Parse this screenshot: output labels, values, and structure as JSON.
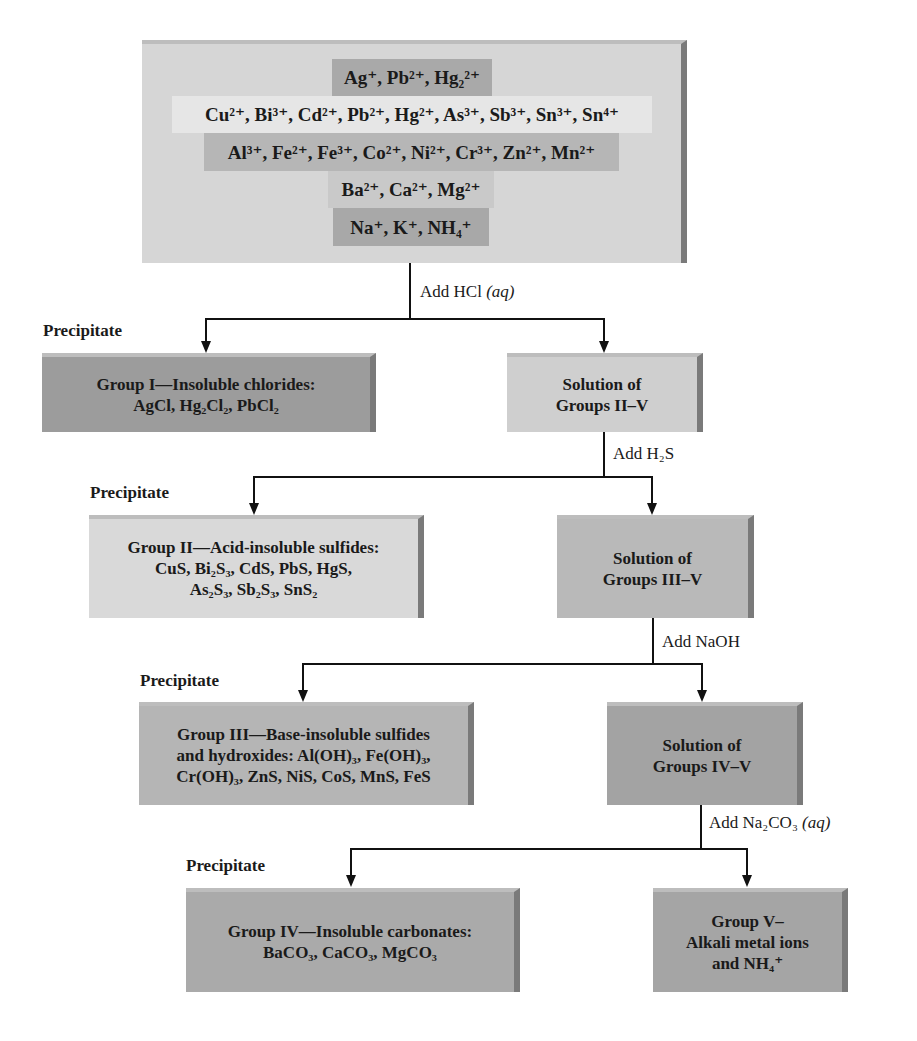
{
  "top_box": {
    "color": "#d6d6d6",
    "rows": [
      {
        "label": "Ag⁺, Pb²⁺, Hg₂²⁺",
        "color": "#a9a9a9"
      },
      {
        "label": "Cu²⁺, Bi³⁺, Cd²⁺, Pb²⁺, Hg²⁺, As³⁺, Sb³⁺, Sn³⁺, Sn⁴⁺",
        "color": "#e6e6e6"
      },
      {
        "label": "Al³⁺, Fe²⁺, Fe³⁺, Co²⁺, Ni²⁺, Cr³⁺, Zn²⁺, Mn²⁺",
        "color": "#b6b6b6"
      },
      {
        "label": "Ba²⁺, Ca²⁺, Mg²⁺",
        "color": "#c9c9c9"
      },
      {
        "label": "Na⁺, K⁺, NH₄⁺",
        "color": "#a8a8a8"
      }
    ]
  },
  "steps": [
    {
      "reagent": "Add HCl",
      "reagent_state": "(aq)",
      "precipitate_label": "Precipitate",
      "precipitate": {
        "title": "Group I—Insoluble chlorides:",
        "lines": [
          "AgCl, Hg₂Cl₂, PbCl₂"
        ],
        "color": "#9c9c9c"
      },
      "solution": {
        "lines": [
          "Solution of",
          "Groups II–V"
        ],
        "color": "#cfcfcf"
      }
    },
    {
      "reagent": "Add H₂S",
      "reagent_state": "",
      "precipitate_label": "Precipitate",
      "precipitate": {
        "title": "Group II—Acid-insoluble sulfides:",
        "lines": [
          "CuS, Bi₂S₃, CdS, PbS, HgS,",
          "As₂S₃, Sb₂S₃, SnS₂"
        ],
        "color": "#d9d9d9"
      },
      "solution": {
        "lines": [
          "Solution of",
          "Groups III–V"
        ],
        "color": "#b9b9b9"
      }
    },
    {
      "reagent": "Add NaOH",
      "reagent_state": "",
      "precipitate_label": "Precipitate",
      "precipitate": {
        "title": "Group III—Base-insoluble sulfides",
        "lines": [
          "and hydroxides: Al(OH)₃, Fe(OH)₃,",
          "Cr(OH)₃, ZnS, NiS, CoS, MnS, FeS"
        ],
        "color": "#b5b5b5"
      },
      "solution": {
        "lines": [
          "Solution of",
          "Groups IV–V"
        ],
        "color": "#a3a3a3"
      }
    },
    {
      "reagent": "Add Na₂CO₃",
      "reagent_state": "(aq)",
      "precipitate_label": "Precipitate",
      "precipitate": {
        "title": "Group IV—Insoluble carbonates:",
        "lines": [
          "BaCO₃, CaCO₃, MgCO₃"
        ],
        "color": "#aaaaaa"
      },
      "solution": {
        "lines": [
          "Group V–",
          "Alkali metal ions",
          "and NH₄⁺"
        ],
        "color": "#a5a5a5"
      }
    }
  ]
}
